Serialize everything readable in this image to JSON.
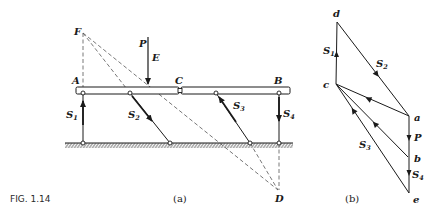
{
  "figure": {
    "caption": "FIG. 1.14",
    "panel_a_label": "(a)",
    "panel_b_label": "(b)"
  },
  "panel_a": {
    "points": {
      "A": "A",
      "B": "B",
      "C": "C",
      "D": "D",
      "E": "E",
      "F": "F",
      "P": "P"
    },
    "bars": [
      {
        "id": "S1",
        "base": "S",
        "sub": "1"
      },
      {
        "id": "S2",
        "base": "S",
        "sub": "2"
      },
      {
        "id": "S3",
        "base": "S",
        "sub": "3"
      },
      {
        "id": "S4",
        "base": "S",
        "sub": "4"
      }
    ]
  },
  "panel_b": {
    "points": {
      "a": "a",
      "b": "b",
      "c": "c",
      "d": "d",
      "e": "e"
    },
    "forces": [
      {
        "id": "S1",
        "base": "S",
        "sub": "1"
      },
      {
        "id": "S2",
        "base": "S",
        "sub": "2"
      },
      {
        "id": "S3",
        "base": "S",
        "sub": "3"
      },
      {
        "id": "S4",
        "base": "S",
        "sub": "4"
      },
      {
        "id": "P",
        "base": "P",
        "sub": ""
      }
    ]
  },
  "colors": {
    "ink": "#1a1a1a",
    "dash": "#555555",
    "beam_fill": "#ffffff"
  }
}
